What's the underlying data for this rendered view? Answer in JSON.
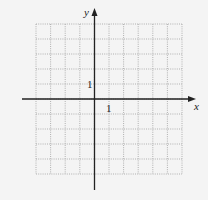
{
  "diagram": {
    "type": "coordinate-grid",
    "x_axis_label": "x",
    "y_axis_label": "y",
    "x_tick_label": "1",
    "y_tick_label": "1",
    "grid": {
      "columns": 10,
      "rows": 10,
      "x_min": -4,
      "x_max": 6,
      "y_min": -5,
      "y_max": 5
    },
    "colors": {
      "background": "#f4f4f4",
      "grid_line": "#a8a8a8",
      "axis": "#222222"
    }
  }
}
